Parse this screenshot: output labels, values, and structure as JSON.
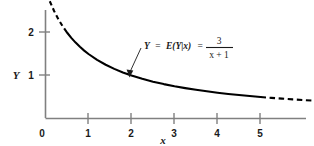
{
  "figure": {
    "background_color": "#ffffff",
    "line_color": "#000000",
    "axis_color": "#808080"
  },
  "annotation": {
    "lhs": "Y",
    "eq1": "=",
    "func": "E(Y|x)",
    "eq2": "=",
    "numerator": "3",
    "denominator": "x + 1",
    "full_text": "Y = E(Y|x) = 3/(x + 1)"
  },
  "axes": {
    "x_label": "x",
    "y_label": "Y",
    "x_ticks": [
      "0",
      "1",
      "2",
      "3",
      "4",
      "5"
    ],
    "y_ticks": [
      "1",
      "2"
    ],
    "origin_label": "0"
  },
  "chart_data": {
    "type": "line",
    "title": "",
    "xlabel": "x",
    "ylabel": "Y",
    "xlim": [
      0,
      6.2
    ],
    "ylim": [
      0,
      2.75
    ],
    "grid": false,
    "legend": null,
    "equation": "Y = E(Y|x) = 3/(x + 1)",
    "annotations": [
      {
        "text": "Y = E(Y|x) = 3/(x + 1)",
        "points_to_x": 2.0,
        "points_to_y": 1.0
      }
    ],
    "xticks": [
      0,
      1,
      2,
      3,
      4,
      5
    ],
    "yticks": [
      1,
      2
    ],
    "series": [
      {
        "name": "E(Y|x) = 3/(x+1) solid",
        "style": "solid",
        "x": [
          0.5,
          0.6,
          0.7,
          0.8,
          0.9,
          1.0,
          1.2,
          1.4,
          1.6,
          1.8,
          2.0,
          2.25,
          2.5,
          2.75,
          3.0,
          3.25,
          3.5,
          3.75,
          4.0,
          4.25,
          4.5,
          4.75,
          5.0
        ],
        "y": [
          2.0,
          1.875,
          1.765,
          1.667,
          1.579,
          1.5,
          1.364,
          1.25,
          1.154,
          1.071,
          1.0,
          0.923,
          0.857,
          0.8,
          0.75,
          0.706,
          0.667,
          0.632,
          0.6,
          0.571,
          0.545,
          0.522,
          0.5
        ]
      },
      {
        "name": "E(Y|x) = 3/(x+1) dashed left",
        "style": "dashed",
        "x": [
          0.1,
          0.2,
          0.3,
          0.4,
          0.5
        ],
        "y": [
          2.727,
          2.5,
          2.308,
          2.143,
          2.0
        ]
      },
      {
        "name": "E(Y|x) = 3/(x+1) dashed right",
        "style": "dashed",
        "x": [
          5.0,
          5.25,
          5.5,
          5.75,
          6.0,
          6.2
        ],
        "y": [
          0.5,
          0.48,
          0.462,
          0.444,
          0.429,
          0.417
        ]
      }
    ]
  }
}
